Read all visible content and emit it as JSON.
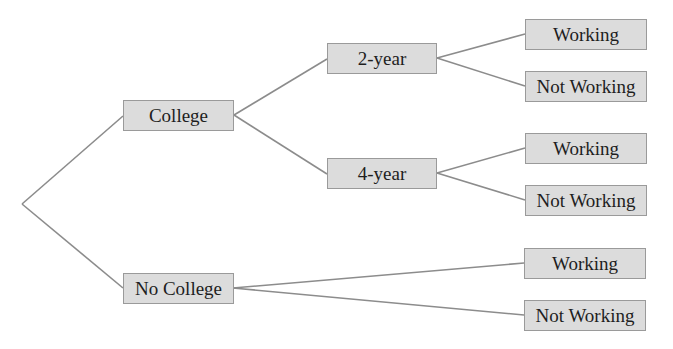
{
  "diagram": {
    "type": "tree",
    "colors": {
      "node_fill": "#dcdcdc",
      "node_border": "#9a9a9a",
      "edge": "#8c8c8c",
      "text": "#1e1e1e"
    },
    "root_point": {
      "x": 22,
      "y": 204
    },
    "nodes": {
      "college": {
        "label": "College",
        "x": 123,
        "y": 100,
        "w": 111,
        "h": 31
      },
      "no_college": {
        "label": "No College",
        "x": 123,
        "y": 273,
        "w": 111,
        "h": 31
      },
      "two_year": {
        "label": "2-year",
        "x": 327,
        "y": 43,
        "w": 110,
        "h": 31
      },
      "four_year": {
        "label": "4-year",
        "x": 327,
        "y": 158,
        "w": 110,
        "h": 31
      },
      "two_year_working": {
        "label": "Working",
        "x": 525,
        "y": 19,
        "w": 122,
        "h": 31
      },
      "two_year_not_working": {
        "label": "Not Working",
        "x": 525,
        "y": 71,
        "w": 122,
        "h": 31
      },
      "four_year_working": {
        "label": "Working",
        "x": 525,
        "y": 133,
        "w": 122,
        "h": 31
      },
      "four_year_not_working": {
        "label": "Not Working",
        "x": 525,
        "y": 185,
        "w": 122,
        "h": 31
      },
      "no_college_working": {
        "label": "Working",
        "x": 524,
        "y": 248,
        "w": 122,
        "h": 31
      },
      "no_college_not_working": {
        "label": "Not Working",
        "x": 524,
        "y": 300,
        "w": 122,
        "h": 31
      }
    }
  }
}
